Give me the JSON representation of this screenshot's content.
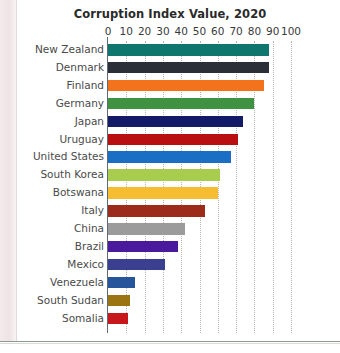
{
  "chart_data": {
    "type": "bar",
    "orientation": "horizontal",
    "title": "Corruption Index Value, 2020",
    "xlabel": "",
    "ylabel": "",
    "xlim": [
      0,
      100
    ],
    "xticks": [
      0,
      10,
      20,
      30,
      40,
      50,
      60,
      70,
      80,
      90,
      100
    ],
    "grid": true,
    "legend": false,
    "categories": [
      "New Zealand",
      "Denmark",
      "Finland",
      "Germany",
      "Japan",
      "Uruguay",
      "United States",
      "South Korea",
      "Botswana",
      "Italy",
      "China",
      "Brazil",
      "Mexico",
      "Venezuela",
      "South Sudan",
      "Somalia"
    ],
    "values": [
      88,
      88,
      85,
      80,
      74,
      71,
      67,
      61,
      60,
      53,
      42,
      38,
      31,
      15,
      12,
      11
    ],
    "colors": [
      "#0f766e",
      "#2b3038",
      "#f3721c",
      "#3f9242",
      "#131a66",
      "#b90f10",
      "#1a6fc4",
      "#a8cc4e",
      "#f5bd32",
      "#9d2b1b",
      "#9b9b9b",
      "#4b1a9c",
      "#3a3f8f",
      "#27559c",
      "#9b7512",
      "#c8161d"
    ]
  },
  "page": {
    "title": "Corruption Index Value, 2020"
  }
}
